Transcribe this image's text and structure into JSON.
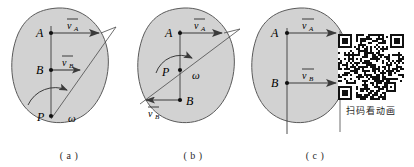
{
  "figure": {
    "type": "mechanics-diagram",
    "background_color": "#ffffff",
    "body_fill_color": "#d2d2d2",
    "body_stroke_color": "#555555",
    "ink_color": "#1a1a1a"
  },
  "panels": [
    {
      "id": "a",
      "caption": "( a )",
      "points": [
        {
          "name": "A",
          "label": "A"
        },
        {
          "name": "B",
          "label": "B"
        },
        {
          "name": "P",
          "label": "P"
        }
      ],
      "vectors": [
        {
          "name": "v_A",
          "label": "v",
          "subscript": "A",
          "direction": "right",
          "magnitude_rel": "long"
        },
        {
          "name": "v_B",
          "label": "v",
          "subscript": "B",
          "direction": "right",
          "magnitude_rel": "short"
        }
      ],
      "angular_velocity": {
        "label": "ω",
        "sense": "counterclockwise-arc"
      },
      "center_position": "below B, inside body"
    },
    {
      "id": "b",
      "caption": "( b )",
      "points": [
        {
          "name": "A",
          "label": "A"
        },
        {
          "name": "B",
          "label": "B"
        },
        {
          "name": "P",
          "label": "P"
        }
      ],
      "vectors": [
        {
          "name": "v_A",
          "label": "v",
          "subscript": "A",
          "direction": "right",
          "magnitude_rel": "long"
        },
        {
          "name": "v_B",
          "label": "v",
          "subscript": "B",
          "direction": "left",
          "magnitude_rel": "medium"
        }
      ],
      "angular_velocity": {
        "label": "ω",
        "sense": "counterclockwise-arc"
      },
      "center_position": "between A and B, inside body"
    },
    {
      "id": "c",
      "caption": "( c )",
      "points": [
        {
          "name": "A",
          "label": "A"
        },
        {
          "name": "B",
          "label": "B"
        }
      ],
      "vectors": [
        {
          "name": "v_A",
          "label": "v",
          "subscript": "A",
          "direction": "right",
          "magnitude_rel": "equal"
        },
        {
          "name": "v_B",
          "label": "v",
          "subscript": "B",
          "direction": "right",
          "magnitude_rel": "equal"
        }
      ],
      "angular_velocity": null,
      "center_position": "at infinity (parallel equal velocities, translation)"
    }
  ],
  "qr": {
    "caption": "扫码看动画",
    "alt_name": "qr-code"
  }
}
